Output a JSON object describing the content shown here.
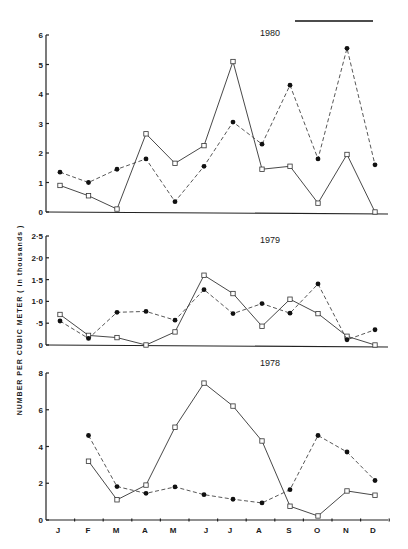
{
  "figure": {
    "ylabel": "NUMBER PER CUBIC METER  ( in thousands )",
    "scale_bar": {
      "x1": 295,
      "x2": 373,
      "y": 21
    },
    "months": [
      "J",
      "F",
      "M",
      "A",
      "M",
      "J",
      "J",
      "A",
      "S",
      "O",
      "N",
      "D"
    ]
  },
  "chart_data": [
    {
      "type": "line",
      "title": "1980",
      "xlabel": "",
      "ylabel": "NUMBER PER CUBIC METER ( in thousands )",
      "categories": [
        "J",
        "F",
        "M",
        "A",
        "M",
        "J",
        "J",
        "A",
        "S",
        "O",
        "N",
        "D"
      ],
      "ylim": [
        0,
        6
      ],
      "yticks": [
        0,
        1,
        2,
        3,
        4,
        5,
        6
      ],
      "ytick_labels": [
        "0",
        "1",
        "2",
        "3",
        "4",
        "5",
        "6"
      ],
      "grid": false,
      "series": [
        {
          "name": "open squares (solid line)",
          "marker": "square",
          "line": "solid",
          "values": [
            0.9,
            0.55,
            0.1,
            2.65,
            1.65,
            2.25,
            5.1,
            1.45,
            1.55,
            0.3,
            1.95,
            0.0
          ]
        },
        {
          "name": "filled circles (dashed line)",
          "marker": "dot",
          "line": "dashed",
          "values": [
            1.35,
            1.0,
            1.45,
            1.8,
            0.35,
            1.55,
            3.05,
            2.3,
            4.3,
            1.8,
            5.55,
            1.6
          ]
        }
      ]
    },
    {
      "type": "line",
      "title": "1979",
      "xlabel": "",
      "ylabel": "NUMBER PER CUBIC METER ( in thousands )",
      "categories": [
        "J",
        "F",
        "M",
        "A",
        "M",
        "J",
        "J",
        "A",
        "S",
        "O",
        "N",
        "D"
      ],
      "ylim": [
        0,
        2.5
      ],
      "yticks": [
        0,
        0.5,
        1.0,
        1.5,
        2.0,
        2.5
      ],
      "ytick_labels": [
        "0",
        "·5",
        "1·0",
        "1·5",
        "2·0",
        "2·5"
      ],
      "grid": false,
      "series": [
        {
          "name": "open squares (solid line)",
          "marker": "square",
          "line": "solid",
          "values": [
            0.7,
            0.22,
            0.17,
            0.0,
            0.3,
            1.6,
            1.18,
            0.43,
            1.05,
            0.72,
            0.2,
            0.0
          ]
        },
        {
          "name": "filled circles (dashed line)",
          "marker": "dot",
          "line": "dashed",
          "values": [
            0.55,
            0.15,
            0.75,
            0.77,
            0.57,
            1.27,
            0.72,
            0.95,
            0.73,
            1.4,
            0.12,
            0.35
          ]
        }
      ]
    },
    {
      "type": "line",
      "title": "1978",
      "xlabel": "",
      "ylabel": "NUMBER PER CUBIC METER ( in thousands )",
      "categories": [
        "J",
        "F",
        "M",
        "A",
        "M",
        "J",
        "J",
        "A",
        "S",
        "O",
        "N",
        "D"
      ],
      "ylim": [
        0,
        8
      ],
      "yticks": [
        0,
        2,
        4,
        6,
        8
      ],
      "ytick_labels": [
        "0",
        "2",
        "4",
        "6",
        "8"
      ],
      "grid": false,
      "series": [
        {
          "name": "open squares (solid line)",
          "marker": "square",
          "line": "solid",
          "values": [
            null,
            3.2,
            1.1,
            1.9,
            5.05,
            7.45,
            6.2,
            4.3,
            0.75,
            0.22,
            1.58,
            1.35
          ]
        },
        {
          "name": "filled circles (dashed line)",
          "marker": "dot",
          "line": "dashed",
          "values": [
            null,
            4.6,
            1.82,
            1.45,
            1.8,
            1.38,
            1.13,
            0.93,
            1.65,
            4.6,
            3.7,
            2.15
          ]
        }
      ]
    }
  ]
}
